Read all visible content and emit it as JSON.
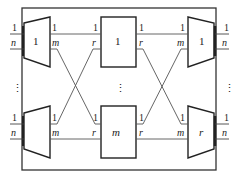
{
  "diagram": {
    "type": "three-stage switching network",
    "input_stage": {
      "switches": [
        {
          "label": "1",
          "inputs": [
            "1",
            "n"
          ],
          "outputs": [
            "1",
            "m"
          ]
        },
        {
          "label": "",
          "inputs": [
            "1",
            "n"
          ],
          "outputs": [
            "1",
            "m"
          ]
        }
      ],
      "ellipsis": "⋮"
    },
    "middle_stage": {
      "switches": [
        {
          "label": "1",
          "inputs": [
            "1",
            "r"
          ],
          "outputs": [
            "1",
            "r"
          ]
        },
        {
          "label": "m",
          "inputs": [
            "1",
            "r"
          ],
          "outputs": [
            "1",
            "r"
          ]
        }
      ],
      "ellipsis": "⋮"
    },
    "output_stage": {
      "switches": [
        {
          "label": "1",
          "inputs": [
            "1",
            "m"
          ],
          "outputs": [
            "1",
            "n"
          ]
        },
        {
          "label": "r",
          "inputs": [
            "1",
            "m"
          ],
          "outputs": [
            "1",
            "n"
          ]
        }
      ],
      "ellipsis": "⋮"
    }
  }
}
